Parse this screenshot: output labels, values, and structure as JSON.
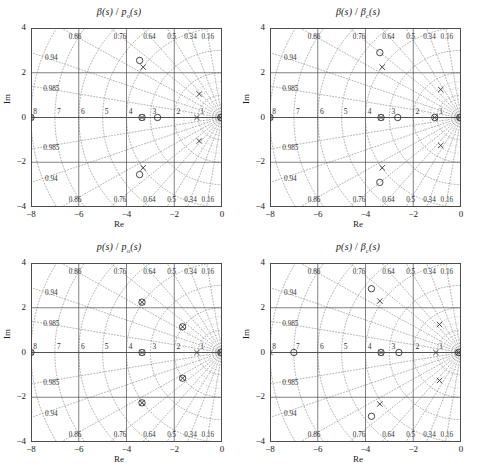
{
  "figure": {
    "panel_count": 4,
    "axis_labels": {
      "x": "Re",
      "y": "Im"
    },
    "x_ticks": [
      "−8",
      "−6",
      "−4",
      "−2",
      "0"
    ],
    "x_tick_values": [
      -8,
      -6,
      -4,
      -2,
      0
    ],
    "y_ticks": [
      "4",
      "2",
      "0",
      "−2",
      "−4"
    ],
    "y_tick_values": [
      4,
      2,
      0,
      -2,
      -4
    ],
    "xlim": [
      -8,
      0
    ],
    "ylim": [
      -4,
      4
    ],
    "grid": true,
    "damping_labels": [
      "0.16",
      "0.34",
      "0.5",
      "0.64",
      "0.76",
      "0.86",
      "0.94",
      "0.985"
    ],
    "damping_values": [
      0.16,
      0.34,
      0.5,
      0.64,
      0.76,
      0.86,
      0.94,
      0.985
    ],
    "frequency_labels": [
      "1",
      "2",
      "3",
      "4",
      "5",
      "6",
      "7",
      "8"
    ],
    "frequency_values": [
      1,
      2,
      3,
      4,
      5,
      6,
      7,
      8
    ],
    "colors": {
      "axis": "#4d4d4d",
      "grid": "#808080",
      "marker": "#333333",
      "background": "#ffffff"
    }
  },
  "chart_data": [
    {
      "id": "top-left",
      "type": "scatter",
      "title": "β(s)/pₒ(s)",
      "title_parts": {
        "numerator": "β(s)",
        "denominator": "p",
        "denominator_sub": "o",
        "denominator_tail": "(s)"
      },
      "xlabel": "Re",
      "ylabel": "Im",
      "xlim": [
        -8,
        0
      ],
      "ylim": [
        -4,
        4
      ],
      "grid": true,
      "series": [
        {
          "name": "zeros",
          "marker": "circle",
          "points": [
            [
              -8.0,
              0.0
            ],
            [
              -3.35,
              0.0
            ],
            [
              -2.7,
              0.0
            ],
            [
              -3.45,
              2.55
            ],
            [
              -3.45,
              -2.55
            ],
            [
              -0.05,
              0.0
            ]
          ]
        },
        {
          "name": "poles",
          "marker": "x",
          "points": [
            [
              -8.0,
              0.0
            ],
            [
              -3.35,
              0.0
            ],
            [
              -3.3,
              2.25
            ],
            [
              -3.3,
              -2.25
            ],
            [
              -0.95,
              1.05
            ],
            [
              -0.95,
              -1.05
            ],
            [
              -1.05,
              0.0
            ],
            [
              -0.05,
              0.0
            ]
          ]
        }
      ]
    },
    {
      "id": "top-right",
      "type": "scatter",
      "title": "β(s)/βₑ(s)",
      "title_parts": {
        "numerator": "β(s)",
        "denominator": "β",
        "denominator_sub": "c",
        "denominator_tail": "(s)"
      },
      "xlabel": "Re",
      "ylabel": "Im",
      "xlim": [
        -8,
        0
      ],
      "ylim": [
        -4,
        4
      ],
      "grid": true,
      "series": [
        {
          "name": "zeros",
          "marker": "circle",
          "points": [
            [
              -8.0,
              0.0
            ],
            [
              -3.35,
              0.0
            ],
            [
              -2.65,
              0.0
            ],
            [
              -1.1,
              0.0
            ],
            [
              -3.4,
              2.9
            ],
            [
              -3.4,
              -2.9
            ],
            [
              -0.05,
              0.0
            ]
          ]
        },
        {
          "name": "poles",
          "marker": "x",
          "points": [
            [
              -8.0,
              0.0
            ],
            [
              -3.35,
              0.0
            ],
            [
              -1.1,
              0.0
            ],
            [
              -3.3,
              2.25
            ],
            [
              -3.3,
              -2.25
            ],
            [
              -0.85,
              1.25
            ],
            [
              -0.85,
              -1.25
            ],
            [
              -0.05,
              0.0
            ]
          ]
        }
      ]
    },
    {
      "id": "bottom-left",
      "type": "scatter",
      "title": "p(s)/pₒ(s)",
      "title_parts": {
        "numerator": "p(s)",
        "denominator": "p",
        "denominator_sub": "o",
        "denominator_tail": "(s)"
      },
      "xlabel": "Re",
      "ylabel": "Im",
      "xlim": [
        -8,
        0
      ],
      "ylim": [
        -4,
        4
      ],
      "grid": true,
      "series": [
        {
          "name": "zeros",
          "marker": "circle",
          "points": [
            [
              -8.0,
              0.0
            ],
            [
              -3.35,
              0.0
            ],
            [
              -3.35,
              2.25
            ],
            [
              -3.35,
              -2.25
            ],
            [
              -1.65,
              1.15
            ],
            [
              -1.65,
              -1.15
            ],
            [
              -0.05,
              0.0
            ]
          ]
        },
        {
          "name": "poles",
          "marker": "x",
          "points": [
            [
              -8.0,
              0.0
            ],
            [
              -3.35,
              0.0
            ],
            [
              -3.35,
              2.25
            ],
            [
              -3.35,
              -2.25
            ],
            [
              -1.65,
              1.15
            ],
            [
              -1.65,
              -1.15
            ],
            [
              -1.05,
              0.0
            ],
            [
              -0.05,
              0.0
            ]
          ]
        }
      ]
    },
    {
      "id": "bottom-right",
      "type": "scatter",
      "title": "p(s)/βₑ(s)",
      "title_parts": {
        "numerator": "p(s)",
        "denominator": "β",
        "denominator_sub": "c",
        "denominator_tail": "(s)"
      },
      "xlabel": "Re",
      "ylabel": "Im",
      "xlim": [
        -8,
        0
      ],
      "ylim": [
        -4,
        4
      ],
      "grid": true,
      "series": [
        {
          "name": "zeros",
          "marker": "circle",
          "points": [
            [
              -7.0,
              0.0
            ],
            [
              -3.35,
              0.0
            ],
            [
              -2.6,
              0.0
            ],
            [
              -3.75,
              2.85
            ],
            [
              -3.75,
              -2.85
            ],
            [
              -0.1,
              0.0
            ]
          ]
        },
        {
          "name": "poles",
          "marker": "x",
          "points": [
            [
              -8.0,
              0.0
            ],
            [
              -3.35,
              0.0
            ],
            [
              -3.4,
              2.3
            ],
            [
              -3.4,
              -2.3
            ],
            [
              -0.9,
              1.25
            ],
            [
              -0.9,
              -1.25
            ],
            [
              -1.05,
              0.0
            ],
            [
              -0.1,
              0.0
            ]
          ]
        }
      ]
    }
  ]
}
